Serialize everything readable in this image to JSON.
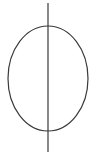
{
  "diagram": {
    "width": 96,
    "height": 166,
    "background": "#ffffff",
    "stroke_color": "#3a3a3a",
    "stroke_width": 1.2,
    "shapes": [
      {
        "type": "ellipse",
        "name": "oval",
        "cx": 48,
        "cy": 78.5,
        "rx": 40,
        "ry": 52.5
      },
      {
        "type": "line",
        "name": "vertical-axis",
        "x1": 48,
        "y1": 3,
        "x2": 48,
        "y2": 152
      }
    ]
  }
}
